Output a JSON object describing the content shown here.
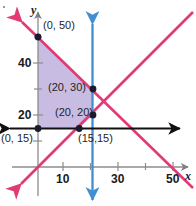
{
  "figure": {
    "background_color": "#ffffff"
  },
  "axes": {
    "x_axis_label": "x",
    "y_axis_label": "y",
    "axis_color": "#8c8c8c",
    "x_range": [
      -6,
      58
    ],
    "y_range": [
      -8,
      58
    ],
    "origin_px": {
      "x": 38,
      "y": 167
    },
    "scale_px_per_unit": {
      "x": 2.75,
      "y": 2.6
    },
    "x_ticks": [
      {
        "value": 10,
        "label": "10"
      },
      {
        "value": 20,
        "label": ""
      },
      {
        "value": 30,
        "label": "30"
      },
      {
        "value": 40,
        "label": ""
      },
      {
        "value": 50,
        "label": "50"
      }
    ],
    "y_ticks": [
      {
        "value": 10,
        "label": ""
      },
      {
        "value": 20,
        "label": "20"
      },
      {
        "value": 30,
        "label": ""
      },
      {
        "value": 40,
        "label": "40"
      },
      {
        "value": 50,
        "label": ""
      }
    ]
  },
  "lines": [
    {
      "name": "descending-constraint-line",
      "color": "#e23a75",
      "from": {
        "x": -6,
        "y": 56
      },
      "to": {
        "x": 58,
        "y": -8
      },
      "passes_through": [
        [
          0,
          50
        ],
        [
          20,
          30
        ],
        [
          50,
          0
        ]
      ],
      "arrow_start": true,
      "arrow_end": false
    },
    {
      "name": "ascending-constraint-line",
      "color": "#e23a75",
      "from": {
        "x": -6,
        "y": -6
      },
      "to": {
        "x": 58,
        "y": 58
      },
      "passes_through": [
        [
          15,
          15
        ],
        [
          20,
          20
        ]
      ],
      "arrow_start": true,
      "arrow_end": false
    },
    {
      "name": "vertical-line-x-equals-20",
      "color": "#3f8fd2",
      "equation": "x = 20",
      "arrow_start": true,
      "arrow_end": true
    },
    {
      "name": "horizontal-line-y-equals-15",
      "color": "#111111",
      "equation": "y = 15",
      "arrow_start": true,
      "arrow_end": true
    }
  ],
  "region": {
    "name": "feasible-region",
    "fill_color": "#c0b0dd",
    "opacity": 0.85,
    "vertices": [
      [
        0,
        50
      ],
      [
        20,
        30
      ],
      [
        20,
        20
      ],
      [
        15,
        15
      ],
      [
        0,
        15
      ]
    ]
  },
  "points": [
    {
      "label": "(0, 50)",
      "x": 0,
      "y": 50,
      "label_px": {
        "left": 43,
        "top": 20
      }
    },
    {
      "label": "(20, 30)",
      "x": 20,
      "y": 30,
      "label_px": {
        "left": 48,
        "top": 81
      }
    },
    {
      "label": "(20, 20)",
      "x": 20,
      "y": 20,
      "label_px": {
        "left": 55,
        "top": 106
      }
    },
    {
      "label": "(0, 15)",
      "x": 0,
      "y": 15,
      "label_px": {
        "left": 2,
        "top": 137
      }
    },
    {
      "label": "(15,15)",
      "x": 15,
      "y": 15,
      "label_px": {
        "left": 78,
        "top": 137
      }
    }
  ],
  "point_marker": {
    "fill": "#1b1b2e",
    "radius_px": 3.4
  }
}
